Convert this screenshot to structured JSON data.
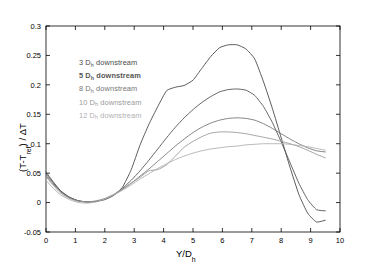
{
  "chart_data": {
    "type": "line",
    "title": "",
    "xlabel": "Y/D_h",
    "xlabel_main": "Y/D",
    "xlabel_sub": "h",
    "ylabel": "(T-T_ref) / ΔT",
    "ylabel_pre": "(T-T",
    "ylabel_sub": "ref",
    "ylabel_post": ") / ΔT",
    "xlim": [
      0,
      10
    ],
    "ylim": [
      -0.05,
      0.3
    ],
    "xticks": [
      "0",
      "1",
      "2",
      "3",
      "4",
      "5",
      "6",
      "7",
      "8",
      "9",
      "10"
    ],
    "yticks": [
      "-0.05",
      "0",
      "0.05",
      "0.1",
      "0.15",
      "0.2",
      "0.25",
      "0.3"
    ],
    "grid": false,
    "legend_position": "upper-left-inside",
    "series": [
      {
        "name": "3 D_h downstream",
        "label_num": "3",
        "label_d": "D",
        "label_sub": "h",
        "label_tail": " downstream",
        "color": "#4a4a4a",
        "x": [
          0.0,
          0.25,
          0.5,
          0.8,
          1.1,
          1.4,
          1.7,
          2.0,
          2.3,
          2.6,
          2.9,
          3.2,
          3.5,
          3.8,
          4.1,
          4.4,
          4.7,
          5.0,
          5.3,
          5.6,
          5.9,
          6.2,
          6.5,
          6.8,
          7.1,
          7.4,
          7.7,
          8.0,
          8.3,
          8.6,
          8.9,
          9.2,
          9.5
        ],
        "y": [
          0.052,
          0.035,
          0.02,
          0.009,
          0.003,
          0.001,
          0.002,
          0.005,
          0.012,
          0.026,
          0.056,
          0.098,
          0.133,
          0.163,
          0.19,
          0.196,
          0.199,
          0.208,
          0.228,
          0.248,
          0.263,
          0.268,
          0.268,
          0.261,
          0.244,
          0.205,
          0.16,
          0.11,
          0.06,
          0.014,
          -0.018,
          -0.033,
          -0.03
        ]
      },
      {
        "name": "5 D_h downstream",
        "label_num": "5",
        "label_d": "D",
        "label_sub": "h",
        "label_tail": " downstream",
        "color": "#555555",
        "x": [
          0.0,
          0.25,
          0.5,
          0.8,
          1.1,
          1.4,
          1.7,
          2.0,
          2.3,
          2.6,
          2.9,
          3.2,
          3.5,
          3.8,
          4.1,
          4.4,
          4.7,
          5.0,
          5.3,
          5.6,
          5.9,
          6.2,
          6.5,
          6.8,
          7.1,
          7.4,
          7.7,
          8.0,
          8.3,
          8.6,
          8.9,
          9.2,
          9.5
        ],
        "y": [
          0.049,
          0.033,
          0.019,
          0.009,
          0.003,
          0.001,
          0.002,
          0.006,
          0.013,
          0.024,
          0.038,
          0.054,
          0.072,
          0.091,
          0.11,
          0.128,
          0.144,
          0.158,
          0.17,
          0.18,
          0.188,
          0.192,
          0.193,
          0.191,
          0.182,
          0.163,
          0.136,
          0.103,
          0.068,
          0.033,
          0.005,
          -0.012,
          -0.014
        ]
      },
      {
        "name": "8 D_h downstream",
        "label_num": "8",
        "label_d": "D",
        "label_sub": "h",
        "label_tail": " downstream",
        "color": "#777777",
        "x": [
          0.0,
          0.25,
          0.5,
          0.8,
          1.1,
          1.4,
          1.7,
          2.0,
          2.3,
          2.6,
          2.9,
          3.2,
          3.5,
          3.8,
          4.1,
          4.4,
          4.7,
          5.0,
          5.3,
          5.6,
          5.9,
          6.2,
          6.5,
          6.8,
          7.1,
          7.4,
          7.7,
          8.0,
          8.3,
          8.6,
          8.9,
          9.2,
          9.5
        ],
        "y": [
          0.046,
          0.031,
          0.018,
          0.008,
          0.003,
          0.001,
          0.002,
          0.006,
          0.013,
          0.022,
          0.033,
          0.045,
          0.057,
          0.07,
          0.083,
          0.096,
          0.108,
          0.119,
          0.128,
          0.135,
          0.14,
          0.143,
          0.144,
          0.143,
          0.14,
          0.134,
          0.126,
          0.117,
          0.108,
          0.1,
          0.093,
          0.088,
          0.086
        ]
      },
      {
        "name": "10 D_h downstream",
        "label_num": "10",
        "label_d": "D",
        "label_sub": "h",
        "label_tail": " downstream",
        "color": "#9a9a9a",
        "x": [
          0.0,
          0.25,
          0.5,
          0.8,
          1.1,
          1.4,
          1.7,
          2.0,
          2.3,
          2.6,
          2.9,
          3.2,
          3.5,
          3.8,
          4.1,
          4.4,
          4.7,
          5.0,
          5.3,
          5.6,
          5.9,
          6.2,
          6.5,
          6.8,
          7.1,
          7.4,
          7.7,
          8.0,
          8.3,
          8.6,
          8.9,
          9.2,
          9.5
        ],
        "y": [
          0.044,
          0.029,
          0.016,
          0.007,
          0.002,
          0.001,
          0.003,
          0.007,
          0.014,
          0.023,
          0.033,
          0.043,
          0.054,
          0.056,
          0.064,
          0.079,
          0.094,
          0.104,
          0.112,
          0.118,
          0.12,
          0.12,
          0.119,
          0.117,
          0.114,
          0.111,
          0.108,
          0.104,
          0.1,
          0.095,
          0.089,
          0.082,
          0.076
        ]
      },
      {
        "name": "12 D_h downstream",
        "label_num": "12",
        "label_d": "D",
        "label_sub": "h",
        "label_tail": " downstream",
        "color": "#b0b0b0",
        "x": [
          0.0,
          0.25,
          0.5,
          0.8,
          1.1,
          1.4,
          1.7,
          2.0,
          2.3,
          2.6,
          2.9,
          3.2,
          3.5,
          3.8,
          4.1,
          4.4,
          4.7,
          5.0,
          5.3,
          5.6,
          5.9,
          6.2,
          6.5,
          6.8,
          7.1,
          7.4,
          7.7,
          8.0,
          8.3,
          8.6,
          8.9,
          9.2,
          9.5
        ],
        "y": [
          0.038,
          0.024,
          0.013,
          0.005,
          0.0,
          -0.001,
          0.001,
          0.006,
          0.013,
          0.021,
          0.03,
          0.04,
          0.049,
          0.058,
          0.066,
          0.073,
          0.079,
          0.084,
          0.088,
          0.091,
          0.093,
          0.095,
          0.096,
          0.098,
          0.099,
          0.1,
          0.1,
          0.1,
          0.099,
          0.097,
          0.095,
          0.092,
          0.089
        ]
      }
    ]
  }
}
